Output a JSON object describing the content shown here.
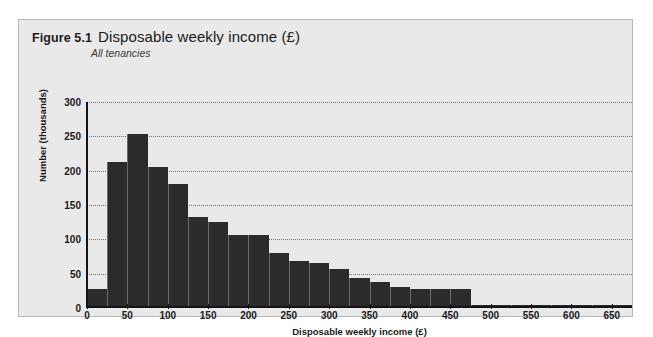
{
  "figure": {
    "number": "Figure 5.1",
    "title": "Disposable weekly income (£)",
    "subtitle": "All tenancies"
  },
  "colors": {
    "bar": "#2b2b2b",
    "background": "#e9e9e9",
    "axis": "#141414",
    "grid": "#6f6f6f"
  },
  "chart_data": {
    "type": "bar",
    "title": "Disposable weekly income (£)",
    "subtitle": "All tenancies",
    "xlabel": "Disposable weekly income (£)",
    "ylabel": "Number (thousands)",
    "xlim": [
      0,
      675
    ],
    "ylim": [
      0,
      300
    ],
    "grid": true,
    "legend": "none",
    "bin_width": 25,
    "xticks": [
      0,
      50,
      100,
      150,
      200,
      250,
      300,
      350,
      400,
      450,
      500,
      550,
      600,
      650
    ],
    "yticks": [
      0,
      50,
      100,
      150,
      200,
      250,
      300
    ],
    "categories": [
      "0-25",
      "25-50",
      "50-75",
      "75-100",
      "100-125",
      "125-150",
      "150-175",
      "175-200",
      "200-225",
      "225-250",
      "250-275",
      "275-300",
      "300-325",
      "325-350",
      "350-375",
      "375-400",
      "400-425",
      "425-450",
      "450-475",
      "475-500",
      "500-525",
      "525-550",
      "550-575",
      "575-600",
      "600-625",
      "625-650",
      "650-675"
    ],
    "bin_starts": [
      0,
      25,
      50,
      75,
      100,
      125,
      150,
      175,
      200,
      225,
      250,
      275,
      300,
      325,
      350,
      375,
      400,
      425,
      450,
      475,
      500,
      525,
      550,
      575,
      600,
      625,
      650
    ],
    "values": [
      28,
      212,
      253,
      205,
      180,
      133,
      125,
      107,
      107,
      80,
      68,
      66,
      57,
      44,
      38,
      30,
      27,
      27,
      27,
      5,
      4,
      4,
      4,
      4,
      4,
      4,
      4
    ]
  }
}
